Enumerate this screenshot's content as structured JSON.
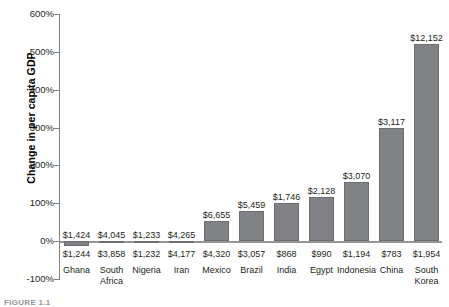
{
  "chart_data": {
    "type": "bar",
    "title": "",
    "xlabel": "",
    "ylabel": "Change in per capita GDP",
    "ylim": [
      -100,
      600
    ],
    "yticks": [
      "-100%",
      "0%",
      "100%",
      "200%",
      "300%",
      "400%",
      "500%",
      "600%"
    ],
    "ytick_values": [
      -100,
      0,
      100,
      200,
      300,
      400,
      500,
      600
    ],
    "grid": false,
    "legend": false,
    "categories": [
      "Ghana",
      "South Africa",
      "Nigeria",
      "Iran",
      "Mexico",
      "Brazil",
      "India",
      "Egypt",
      "Indonesia",
      "China",
      "South Korea"
    ],
    "values": [
      -14,
      -5,
      0,
      -2,
      54,
      79,
      101,
      115,
      157,
      298,
      522
    ],
    "value_labels_top": [
      "$1,424",
      "$4,045",
      "$1,233",
      "$4,265",
      "$6,655",
      "$5,459",
      "$1,746",
      "$2,128",
      "$3,070",
      "$3,117",
      "$12,152"
    ],
    "value_labels_bottom": [
      "$1,244",
      "$3,858",
      "$1,232",
      "$4,177",
      "$4,320",
      "$3,057",
      "$868",
      "$990",
      "$1,194",
      "$783",
      "$1,954"
    ]
  },
  "axis": {
    "y_title": "Change in per capita GDP"
  },
  "caption": {
    "figure_label": "FIGURE 1.1"
  },
  "colors": {
    "bar_fill": "#808285",
    "axis": "#808285",
    "text": "#231f20"
  }
}
